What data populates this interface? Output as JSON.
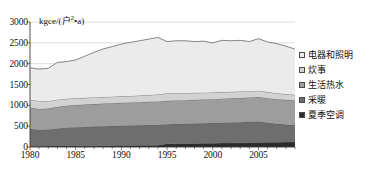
{
  "chart_data": {
    "type": "area",
    "stacked": true,
    "title": "",
    "xlabel": "",
    "ylabel": "",
    "unit_label": "kgce/(户·a)",
    "unit_label_prefix": "kgce/(",
    "unit_label_base": "户",
    "unit_label_sup": "2",
    "unit_label_suffix": "•a)",
    "ylim": [
      0,
      3000
    ],
    "yticks": [
      0,
      500,
      1000,
      1500,
      2000,
      2500,
      3000
    ],
    "ytick_labels": [
      "0",
      "500",
      "1000",
      "1500",
      "2000",
      "2500",
      "3000"
    ],
    "xlim": [
      1980,
      2009
    ],
    "xticks": [
      1980,
      1985,
      1990,
      1995,
      2000,
      2005
    ],
    "xtick_labels": [
      "1980",
      "1985",
      "1990",
      "1995",
      "2000",
      "2005"
    ],
    "x": [
      1980,
      1981,
      1982,
      1983,
      1984,
      1985,
      1986,
      1987,
      1988,
      1989,
      1990,
      1991,
      1992,
      1993,
      1994,
      1995,
      1996,
      1997,
      1998,
      1999,
      2000,
      2001,
      2002,
      2003,
      2004,
      2005,
      2006,
      2007,
      2008,
      2009
    ],
    "grid": true,
    "grid_axis": "y",
    "legend_position": "right",
    "series": [
      {
        "name": "夏季空调",
        "color": "#2b2b2b",
        "order": 0,
        "values": [
          20,
          20,
          22,
          24,
          25,
          27,
          28,
          30,
          32,
          34,
          36,
          38,
          40,
          42,
          45,
          78,
          80,
          82,
          85,
          88,
          92,
          95,
          98,
          100,
          104,
          108,
          112,
          116,
          118,
          120
        ]
      },
      {
        "name": "采暖",
        "color": "#6e6e6e",
        "order": 1,
        "values": [
          420,
          390,
          400,
          420,
          440,
          450,
          455,
          460,
          465,
          470,
          475,
          478,
          480,
          485,
          490,
          470,
          472,
          475,
          478,
          480,
          482,
          488,
          492,
          496,
          500,
          505,
          470,
          440,
          420,
          400
        ]
      },
      {
        "name": "生活热水",
        "color": "#9d9d9d",
        "order": 2,
        "values": [
          510,
          505,
          500,
          520,
          525,
          530,
          535,
          540,
          545,
          548,
          550,
          552,
          555,
          558,
          560,
          562,
          565,
          568,
          570,
          572,
          575,
          578,
          580,
          582,
          585,
          588,
          590,
          592,
          594,
          596
        ]
      },
      {
        "name": "炊事",
        "color": "#d2d2d2",
        "order": 3,
        "values": [
          190,
          185,
          178,
          172,
          168,
          165,
          162,
          160,
          158,
          156,
          155,
          158,
          160,
          163,
          166,
          178,
          176,
          172,
          168,
          164,
          160,
          158,
          156,
          154,
          152,
          150,
          146,
          142,
          138,
          134
        ]
      },
      {
        "name": "电器和照明",
        "color": "#ebebeb",
        "order": 4,
        "values": [
          760,
          770,
          790,
          894,
          892,
          918,
          1000,
          1080,
          1152,
          1202,
          1254,
          1284,
          1315,
          1342,
          1369,
          1242,
          1257,
          1253,
          1229,
          1236,
          1191,
          1241,
          1224,
          1228,
          1189,
          1249,
          1202,
          1190,
          1150,
          1100
        ]
      }
    ],
    "totals": [
      1900,
      1870,
      1890,
      2030,
      2050,
      2090,
      2180,
      2270,
      2352,
      2410,
      2470,
      2510,
      2550,
      2590,
      2630,
      2530,
      2550,
      2550,
      2530,
      2540,
      2500,
      2560,
      2550,
      2560,
      2530,
      2600,
      2520,
      2480,
      2420,
      2350
    ]
  },
  "legend": {
    "items": [
      {
        "label": "电器和照明",
        "color": "#ebebeb"
      },
      {
        "label": "炊事",
        "color": "#d2d2d2"
      },
      {
        "label": "生活热水",
        "color": "#9d9d9d"
      },
      {
        "label": "采暖",
        "color": "#6e6e6e"
      },
      {
        "label": "夏季空调",
        "color": "#2b2b2b"
      }
    ]
  },
  "style": {
    "background": "#ffffff",
    "axis_color": "#3a3a3a",
    "grid_color": "#c9c9c9",
    "line_color": "#555555"
  }
}
